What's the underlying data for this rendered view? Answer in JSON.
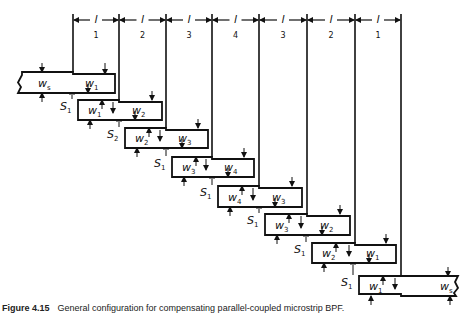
{
  "diagram": {
    "stroke_color": "#111111",
    "background": "#ffffff",
    "section_length_symbol": "l",
    "dimension_lines": {
      "x_positions": [
        73,
        119,
        166,
        212,
        259,
        307,
        355,
        401
      ],
      "sections": [
        {
          "label": "l",
          "index": "1"
        },
        {
          "label": "l",
          "index": "2"
        },
        {
          "label": "l",
          "index": "3"
        },
        {
          "label": "l",
          "index": "4"
        },
        {
          "label": "l",
          "index": "3"
        },
        {
          "label": "l",
          "index": "2"
        },
        {
          "label": "l",
          "index": "1"
        }
      ]
    },
    "resonators": [
      {
        "name": "input-feed-line",
        "left_width": "s",
        "right_width": "1"
      },
      {
        "name": "resonator-1",
        "left_width": "1",
        "right_width": "2"
      },
      {
        "name": "resonator-2",
        "left_width": "2",
        "right_width": "3"
      },
      {
        "name": "resonator-3",
        "left_width": "3",
        "right_width": "4"
      },
      {
        "name": "resonator-4",
        "left_width": "4",
        "right_width": "3"
      },
      {
        "name": "resonator-5",
        "left_width": "3",
        "right_width": "2"
      },
      {
        "name": "resonator-6",
        "left_width": "2",
        "right_width": "1"
      },
      {
        "name": "output-feed-line",
        "left_width": "1",
        "right_width": "s"
      }
    ],
    "width_symbol": "W",
    "gap_symbol": "S",
    "gaps": [
      "1",
      "1",
      "2",
      "1",
      "1",
      "1",
      "1",
      "1"
    ],
    "gap_labels": [
      {
        "sub": "1"
      },
      {
        "sub": "2"
      },
      {
        "sub": "1"
      },
      {
        "sub": "1"
      },
      {
        "sub": "1"
      },
      {
        "sub": "1"
      },
      {
        "sub": "1"
      }
    ]
  },
  "caption": {
    "figure_number": "Figure 4.15",
    "text": "General configuration for compensating parallel-coupled microstrip BPF."
  }
}
